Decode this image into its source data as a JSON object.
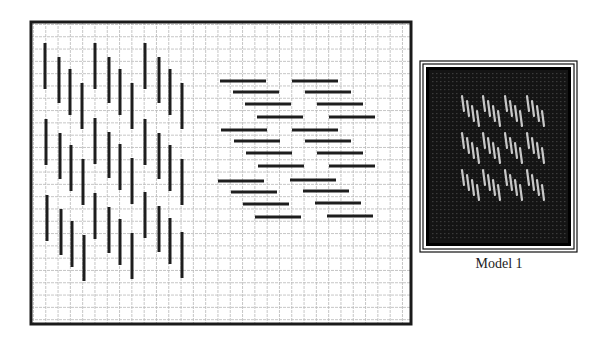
{
  "diagram": {
    "type": "needlepoint-stitch-chart",
    "grid": {
      "frame": {
        "x": 31,
        "y": 22,
        "width": 380,
        "height": 302
      },
      "cell_size": 12.3,
      "line_color": "#b8b8b8",
      "frame_color": "#1a1a1a"
    },
    "stitch_color": "#1e1e1e",
    "stitch_length": 46,
    "vertical_stitches": {
      "group_x_offsets": [
        0,
        14,
        25,
        37
      ],
      "group_y_offsets": [
        0,
        14,
        26,
        40
      ],
      "groups": [
        {
          "x": 45,
          "y": 43
        },
        {
          "x": 95,
          "y": 43
        },
        {
          "x": 145,
          "y": 43
        },
        {
          "x": 46,
          "y": 119
        },
        {
          "x": 95,
          "y": 118
        },
        {
          "x": 145,
          "y": 119
        },
        {
          "x": 47,
          "y": 195
        },
        {
          "x": 95,
          "y": 193
        },
        {
          "x": 145,
          "y": 192
        }
      ]
    },
    "horizontal_stitches": {
      "group_x_offsets": [
        0,
        13,
        25,
        37
      ],
      "group_y_offsets": [
        0,
        11,
        23,
        36
      ],
      "groups": [
        {
          "x": 220,
          "y": 81
        },
        {
          "x": 292,
          "y": 81
        },
        {
          "x": 221,
          "y": 130
        },
        {
          "x": 292,
          "y": 130
        },
        {
          "x": 218,
          "y": 181
        },
        {
          "x": 290,
          "y": 180
        }
      ]
    }
  },
  "model": {
    "label": "Model 1",
    "frame": {
      "x": 420,
      "y": 61,
      "width": 157,
      "height": 191
    },
    "canvas_color": "#141414",
    "stitch_color": "#c8c8c8",
    "rows": [
      {
        "y": 96
      },
      {
        "y": 133
      },
      {
        "y": 170
      }
    ],
    "group_xs": [
      462,
      483,
      505,
      527
    ],
    "stitches_per_group": 4,
    "stitch_length": 15
  }
}
